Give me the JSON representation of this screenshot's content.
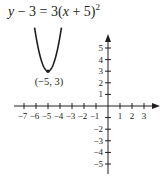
{
  "chart_data": {
    "type": "line",
    "equation": {
      "lhs": "y − 3",
      "eq": "=",
      "coef": "3",
      "inner": "x + 5",
      "exponent": "2"
    },
    "series": [
      {
        "name": "parabola",
        "function": "y = 3(x + 5)^2 + 3",
        "x": [
          -6.12,
          -6,
          -5.75,
          -5.5,
          -5.25,
          -5,
          -4.75,
          -4.5,
          -4.25,
          -4,
          -3.88
        ],
        "values": [
          6.76,
          6,
          4.69,
          3.75,
          3.19,
          3,
          3.19,
          3.75,
          4.69,
          6,
          6.76
        ]
      }
    ],
    "annotations": [
      {
        "text": "(−5, 3)",
        "x": -5,
        "y": 3
      }
    ],
    "vertex": {
      "x": -5,
      "y": 3,
      "label": "(−5, 3)"
    },
    "x_ticks": [
      -7,
      -6,
      -5,
      -4,
      -3,
      -2,
      -1,
      1,
      2,
      3
    ],
    "x_tick_labels": [
      "−7",
      "−6",
      "−5",
      "−4",
      "−3",
      "−2",
      "−1",
      "1",
      "2",
      "3"
    ],
    "y_ticks_labeled": [
      5,
      4,
      3,
      2,
      1,
      -2,
      -3,
      -4,
      -5
    ],
    "y_tick_labels": [
      "5",
      "4",
      "3",
      "2",
      "1",
      "−2",
      "−3",
      "−4",
      "−5"
    ],
    "xlim": [
      -8,
      4
    ],
    "ylim": [
      -5.5,
      6
    ],
    "xlabel": "",
    "ylabel": "",
    "grid": false,
    "legend": "none"
  },
  "colors": {
    "ink": "#231f20",
    "background": "#ffffff"
  }
}
